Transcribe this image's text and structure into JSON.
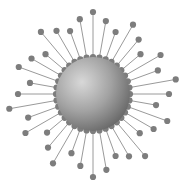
{
  "figure": {
    "canvas": {
      "width": 185,
      "height": 192,
      "background": "#ffffff"
    }
  },
  "chart_data": {
    "type": "scatter",
    "title": "",
    "subtitle": "",
    "xlabel": "",
    "ylabel": "",
    "grid": false,
    "legend": null,
    "annotations": [],
    "coordinate_system": "polar",
    "center": {
      "x": 93,
      "y": 94
    },
    "core": {
      "name": "central-sphere",
      "radius": 37,
      "fill_highlight": "#d2d2d2",
      "fill_mid": "#a0a0a0",
      "fill_shadow": "#6a6a6a",
      "highlight_offset_x": -0.3,
      "highlight_offset_y": -0.32
    },
    "spoke_style": {
      "line_color": "#9a9a9a",
      "line_width": 1,
      "dot_color": "#7d7d7d",
      "dot_radius": 3.1,
      "inner_dot_radius": 3.1,
      "inner_radius": 37
    },
    "xlim": [
      0,
      185
    ],
    "ylim": [
      0,
      192
    ],
    "series": [
      {
        "name": "spokes",
        "units": "degrees / pixels",
        "angles": [
          0,
          10,
          20,
          30,
          40,
          50,
          60,
          70,
          80,
          90,
          100,
          110,
          120,
          130,
          140,
          150,
          160,
          170,
          180,
          190,
          200,
          210,
          220,
          230,
          240,
          250,
          260,
          270,
          280,
          290,
          300,
          310,
          320,
          330,
          340,
          350
        ],
        "outer_radii": [
          82,
          74,
          66,
          80,
          71,
          62,
          78,
          69,
          84,
          76,
          64,
          79,
          70,
          61,
          81,
          72,
          66,
          77,
          83,
          73,
          63,
          80,
          70,
          60,
          78,
          69,
          85,
          75,
          64,
          79,
          71,
          62,
          81,
          73,
          67,
          76
        ]
      }
    ]
  }
}
